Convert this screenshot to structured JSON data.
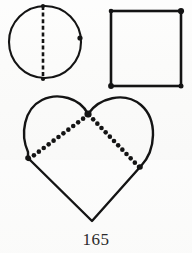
{
  "page": {
    "page_number": "165",
    "background_color": "#fbfbfa",
    "ink_color": "#141414"
  },
  "figures": [
    {
      "id": "circle-figure",
      "name": "circle-with-dashed-diameter",
      "shape": "circle",
      "stroke_color": "#141414",
      "center": {
        "x": 45,
        "y": 42
      },
      "radius": 36,
      "stroke_width": 2.1,
      "internal_line": {
        "name": "dashed-vertical-diameter",
        "style": "dashed",
        "from": {
          "x": 43,
          "y": 6
        },
        "to": {
          "x": 43,
          "y": 79
        },
        "dash_pattern": "4,2.6",
        "stroke_width": 2.6
      },
      "marker_dots": [
        {
          "name": "dot-top",
          "x": 43,
          "y": 6,
          "r": 2.1
        },
        {
          "name": "dot-bottom",
          "x": 43,
          "y": 79,
          "r": 2.1
        },
        {
          "name": "dot-right-edge",
          "x": 80,
          "y": 38,
          "r": 2.6
        }
      ]
    },
    {
      "id": "square-figure",
      "name": "square-with-corner-dots",
      "shape": "square",
      "stroke_color": "#141414",
      "x": 111,
      "y": 11,
      "width": 70,
      "height": 75,
      "stroke_width": 2.6,
      "marker_dots": [
        {
          "name": "dot-corner-top-left",
          "x": 111,
          "y": 11,
          "r": 2.3
        },
        {
          "name": "dot-corner-top-right",
          "x": 181,
          "y": 11,
          "r": 3.1
        },
        {
          "name": "dot-corner-bottom-right",
          "x": 181,
          "y": 86,
          "r": 2.5
        },
        {
          "name": "dot-corner-bottom-left",
          "x": 111,
          "y": 86,
          "r": 2.9
        }
      ]
    },
    {
      "id": "heart-figure",
      "name": "heart-with-dotted-chords",
      "shape": "heart",
      "stroke_color": "#141414",
      "stroke_width": 2.4,
      "outline_path": "M 88 114 C 80 98 58 92 42 100 C 24 109 20 134 28 152 L 28 158 L 92 221 L 141 166 C 156 150 158 120 141 105 C 124 91 99 98 88 114 Z",
      "notch": {
        "x": 88,
        "y": 114
      },
      "bottom_point": {
        "x": 92,
        "y": 221
      },
      "left_point": {
        "x": 27,
        "y": 159
      },
      "right_point": {
        "x": 140,
        "y": 168
      },
      "internal_lines": [
        {
          "name": "dotted-chord-left",
          "style": "dotted",
          "from": {
            "x": 88,
            "y": 115
          },
          "to": {
            "x": 29,
            "y": 159
          },
          "dot_count": 13,
          "dot_radius": 2.3
        },
        {
          "name": "dotted-chord-right",
          "style": "dotted",
          "from": {
            "x": 89,
            "y": 115
          },
          "to": {
            "x": 139,
            "y": 167
          },
          "dot_count": 13,
          "dot_radius": 2.3
        }
      ],
      "marker_dots": [
        {
          "name": "dot-notch-center",
          "x": 88,
          "y": 114,
          "r": 3.6
        },
        {
          "name": "dot-left-vertex",
          "x": 28,
          "y": 158,
          "r": 2.8
        },
        {
          "name": "dot-right-vertex",
          "x": 140,
          "y": 167,
          "r": 2.8
        }
      ]
    }
  ]
}
